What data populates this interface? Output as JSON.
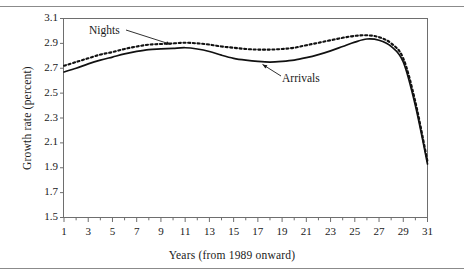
{
  "chart_data": {
    "type": "line",
    "title": "",
    "xlabel": "Years (from 1989 onward)",
    "ylabel": "Growth rate (percent)",
    "xlim": [
      1,
      31
    ],
    "ylim": [
      1.5,
      3.1
    ],
    "xticks": [
      1,
      2,
      3,
      4,
      5,
      6,
      7,
      8,
      9,
      10,
      11,
      12,
      13,
      14,
      15,
      16,
      17,
      18,
      19,
      20,
      21,
      22,
      23,
      24,
      25,
      26,
      27,
      28,
      29,
      30,
      31
    ],
    "xtick_labels": [
      "1",
      "",
      "3",
      "",
      "5",
      "",
      "7",
      "",
      "9",
      "",
      "11",
      "",
      "13",
      "",
      "15",
      "",
      "17",
      "",
      "19",
      "",
      "21",
      "",
      "23",
      "",
      "25",
      "",
      "27",
      "",
      "29",
      "",
      "31"
    ],
    "yticks": [
      1.5,
      1.7,
      1.9,
      2.1,
      2.3,
      2.5,
      2.7,
      2.9,
      3.1
    ],
    "ytick_labels": [
      "1.5",
      "1.7",
      "1.9",
      "2.1",
      "2.3",
      "2.5",
      "2.7",
      "2.9",
      "3.1"
    ],
    "grid": false,
    "legend_position": "inline-annotations",
    "annotations": [
      {
        "text": "Nights",
        "series": "Nights",
        "x": 8.2,
        "y": 2.89
      },
      {
        "text": "Arrivals",
        "series": "Arrivals",
        "x": 18.5,
        "y": 2.74
      }
    ],
    "x": [
      1,
      2,
      3,
      4,
      5,
      6,
      7,
      8,
      9,
      10,
      11,
      12,
      13,
      14,
      15,
      16,
      17,
      18,
      19,
      20,
      21,
      22,
      23,
      24,
      25,
      26,
      27,
      28,
      29,
      30,
      31
    ],
    "series": [
      {
        "name": "Nights",
        "style": "dotted",
        "color": "#111111",
        "values": [
          2.72,
          2.75,
          2.78,
          2.81,
          2.83,
          2.855,
          2.875,
          2.89,
          2.895,
          2.9,
          2.905,
          2.9,
          2.89,
          2.875,
          2.865,
          2.855,
          2.85,
          2.85,
          2.855,
          2.865,
          2.885,
          2.905,
          2.925,
          2.945,
          2.96,
          2.965,
          2.95,
          2.9,
          2.78,
          2.43,
          1.95
        ]
      },
      {
        "name": "Arrivals",
        "style": "solid",
        "color": "#111111",
        "values": [
          2.67,
          2.7,
          2.735,
          2.765,
          2.79,
          2.815,
          2.835,
          2.85,
          2.855,
          2.86,
          2.865,
          2.855,
          2.835,
          2.805,
          2.78,
          2.765,
          2.755,
          2.75,
          2.755,
          2.765,
          2.785,
          2.81,
          2.84,
          2.875,
          2.91,
          2.935,
          2.925,
          2.875,
          2.75,
          2.4,
          1.93
        ]
      }
    ]
  }
}
